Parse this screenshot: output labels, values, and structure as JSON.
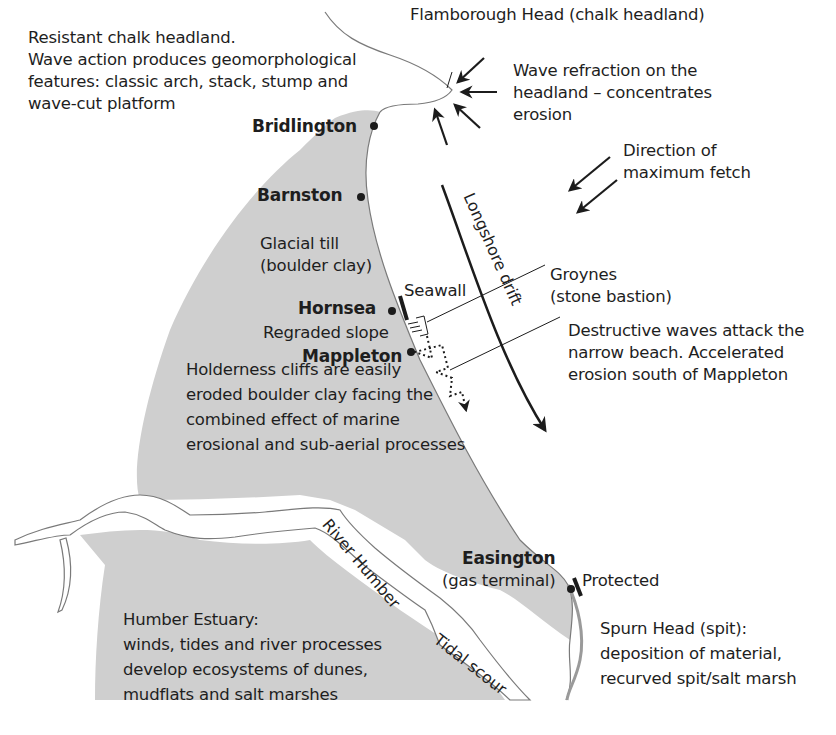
{
  "diagram": {
    "colors": {
      "land": "#cfcfcf",
      "sea": "#ffffff",
      "ink": "#1c1c1c",
      "coastline": "#7a7a7a"
    }
  },
  "annotations": {
    "chalk_headland": [
      "Resistant chalk headland.",
      "Wave action produces geomorphological",
      "features: classic arch, stack, stump and",
      "wave-cut platform"
    ],
    "flamborough": "Flamborough Head (chalk headland)",
    "wave_refraction": [
      "Wave refraction on the",
      "headland – concentrates",
      "erosion"
    ],
    "fetch": [
      "Direction of",
      "maximum fetch"
    ],
    "glacial_till": [
      "Glacial till",
      "(boulder clay)"
    ],
    "seawall": "Seawall",
    "groynes": [
      "Groynes",
      "(stone bastion)"
    ],
    "regraded_slope": "Regraded slope",
    "destructive_waves": [
      "Destructive waves attack the",
      "narrow beach.  Accelerated",
      "erosion south of Mappleton"
    ],
    "holderness": [
      "Holderness cliffs are easily",
      "eroded boulder clay facing the",
      "combined effect of marine",
      "erosional and sub-aerial processes"
    ],
    "longshore": "Longshore  drift",
    "river_humber": "River Humber",
    "tidal_scour": "Tidal scour",
    "gas_terminal": "(gas terminal)",
    "protected": "Protected",
    "spurn": [
      "Spurn Head (spit):",
      "deposition of material,",
      "recurved spit/salt marsh"
    ],
    "humber_estuary": [
      "Humber Estuary:",
      "winds, tides and river processes",
      "develop ecosystems of dunes,",
      "mudflats and salt marshes"
    ]
  },
  "places": [
    {
      "name": "Bridlington"
    },
    {
      "name": "Barnston"
    },
    {
      "name": "Hornsea"
    },
    {
      "name": "Mappleton"
    },
    {
      "name": "Easington"
    }
  ]
}
